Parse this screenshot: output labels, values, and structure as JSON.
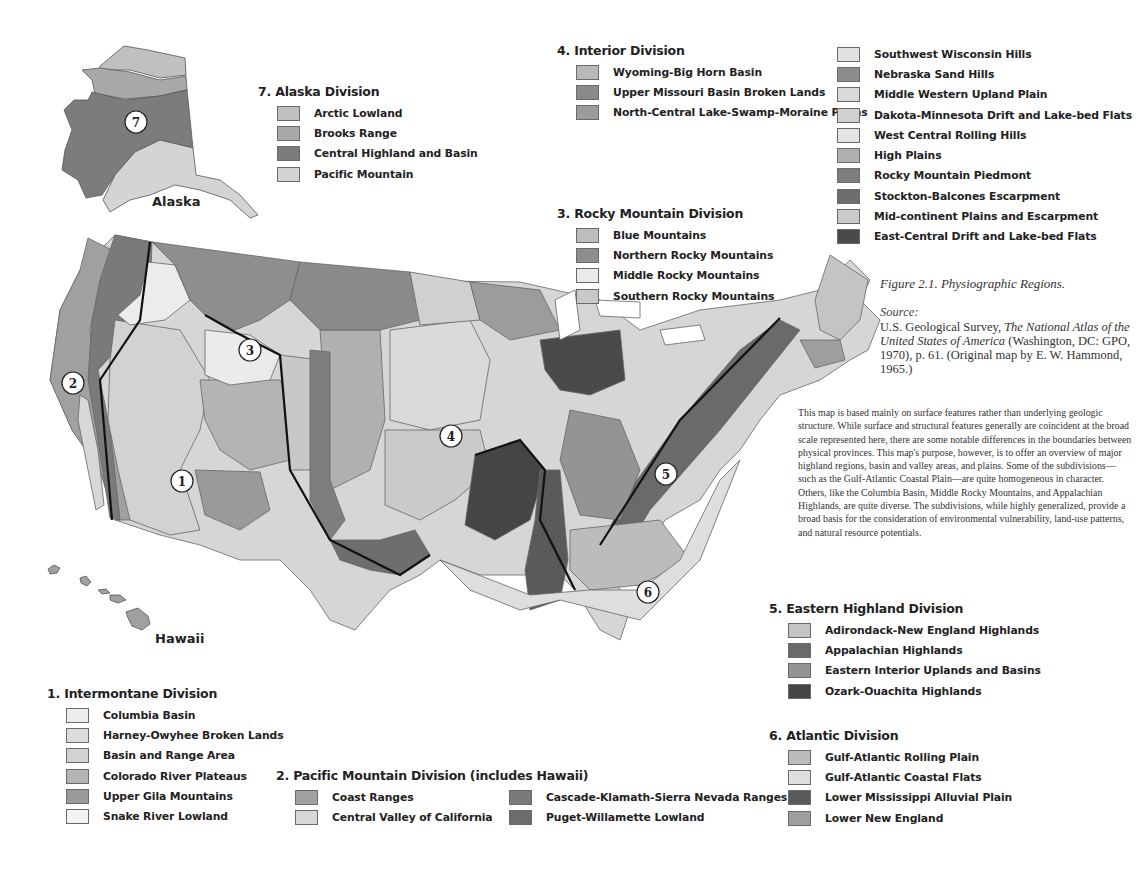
{
  "figure": {
    "title": "Figure 2.1.  Physiographic Regions.",
    "source_label": "Source:",
    "source_pre": "U.S. Geological Survey, ",
    "source_title": "The National Atlas of the United States of America",
    "source_post": " (Washington, DC: GPO, 1970), p. 61. (Original map by E. W. Hammond, 1965.)",
    "description": "This map is based mainly on surface features rather than underlying geologic structure. While surface and structural features generally are coincident at the broad scale represented here, there are some notable differences in the boundaries between physical provinces. This map's purpose, however, is to offer an overview of major highland regions, basin and valley areas, and plains. Some of the subdivisions—such as the Gulf-Atlantic Coastal Plain—are quite homogeneous in character. Others, like the Columbia Basin, Middle Rocky Mountains, and Appalachian Highlands, are quite diverse. The subdivisions, while highly generalized, provide a broad basis for the consideration of environmental vulnerability, land-use patterns, and natural resource potentials."
  },
  "map": {
    "place_labels": {
      "alaska": "Alaska",
      "hawaii": "Hawaii"
    },
    "division_markers": [
      "1",
      "2",
      "3",
      "4",
      "5",
      "6",
      "7"
    ]
  },
  "legends": {
    "intermontane": {
      "title": "1. Intermontane Division",
      "items": [
        {
          "label": "Columbia Basin",
          "color": "#ececec"
        },
        {
          "label": "Harney-Owyhee Broken Lands",
          "color": "#dcdcdc"
        },
        {
          "label": "Basin and Range Area",
          "color": "#d2d2d2"
        },
        {
          "label": "Colorado River Plateaus",
          "color": "#b4b4b4"
        },
        {
          "label": "Upper Gila Mountains",
          "color": "#9a9a9a"
        },
        {
          "label": "Snake River Lowland",
          "color": "#f3f3f3"
        }
      ]
    },
    "pacific": {
      "title": "2. Pacific Mountain Division (includes Hawaii)",
      "items": [
        {
          "label": "Coast Ranges",
          "color": "#a0a0a0"
        },
        {
          "label": "Cascade-Klamath-Sierra Nevada Ranges",
          "color": "#7a7a7a"
        },
        {
          "label": "Central Valley of California",
          "color": "#d8d8d8"
        },
        {
          "label": "Puget-Willamette Lowland",
          "color": "#6c6c6c"
        }
      ]
    },
    "rocky": {
      "title": "3. Rocky Mountain Division",
      "items": [
        {
          "label": "Blue Mountains",
          "color": "#bdbdbd"
        },
        {
          "label": "Northern Rocky Mountains",
          "color": "#8e8e8e"
        },
        {
          "label": "Middle Rocky Mountains",
          "color": "#ebebeb"
        },
        {
          "label": "Southern Rocky Mountains",
          "color": "#c8c8c8"
        }
      ]
    },
    "interior": {
      "title": "4. Interior Division",
      "items": [
        {
          "label": "Wyoming-Big Horn Basin",
          "color": "#b8b8b8"
        },
        {
          "label": "Upper Missouri Basin Broken Lands",
          "color": "#8a8a8a"
        },
        {
          "label": "North-Central Lake-Swamp-Moraine Plains",
          "color": "#9c9c9c"
        },
        {
          "label": "Southwest Wisconsin Hills",
          "color": "#e2e2e2"
        },
        {
          "label": "Nebraska Sand Hills",
          "color": "#8c8c8c"
        },
        {
          "label": "Middle Western Upland Plain",
          "color": "#dadada"
        },
        {
          "label": "Dakota-Minnesota Drift and Lake-bed Flats",
          "color": "#d0d0d0"
        },
        {
          "label": "West Central Rolling Hills",
          "color": "#e4e4e4"
        },
        {
          "label": "High Plains",
          "color": "#b0b0b0"
        },
        {
          "label": "Rocky Mountain Piedmont",
          "color": "#7e7e7e"
        },
        {
          "label": "Stockton-Balcones Escarpment",
          "color": "#6e6e6e"
        },
        {
          "label": "Mid-continent Plains and Escarpment",
          "color": "#cacaca"
        },
        {
          "label": "East-Central Drift and Lake-bed Flats",
          "color": "#4a4a4a"
        }
      ]
    },
    "eastern": {
      "title": "5. Eastern Highland Division",
      "items": [
        {
          "label": "Adirondack-New England Highlands",
          "color": "#c4c4c4"
        },
        {
          "label": "Appalachian Highlands",
          "color": "#6a6a6a"
        },
        {
          "label": "Eastern Interior Uplands and Basins",
          "color": "#949494"
        },
        {
          "label": "Ozark-Ouachita Highlands",
          "color": "#454545"
        }
      ]
    },
    "atlantic": {
      "title": "6. Atlantic Division",
      "items": [
        {
          "label": "Gulf-Atlantic Rolling Plain",
          "color": "#bcbcbc"
        },
        {
          "label": "Gulf-Atlantic Coastal Flats",
          "color": "#dedede"
        },
        {
          "label": "Lower Mississippi Alluvial Plain",
          "color": "#5a5a5a"
        },
        {
          "label": "Lower New England",
          "color": "#9e9e9e"
        }
      ]
    },
    "alaska": {
      "title": "7. Alaska Division",
      "items": [
        {
          "label": "Arctic Lowland",
          "color": "#c0c0c0"
        },
        {
          "label": "Brooks Range",
          "color": "#a8a8a8"
        },
        {
          "label": "Central Highland and Basin",
          "color": "#7c7c7c"
        },
        {
          "label": "Pacific Mountain",
          "color": "#d4d4d4"
        }
      ]
    }
  }
}
